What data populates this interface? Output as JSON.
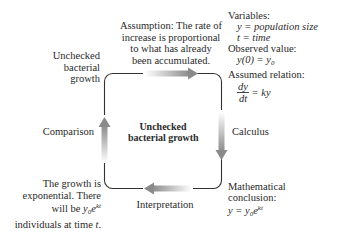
{
  "diagram": {
    "center_label": [
      "Unchecked",
      "bacterial growth"
    ],
    "stages": {
      "top": "Assumption: The rate of increase is proportional to what has already been accumulated.",
      "top_lines": [
        "Assumption: The rate of",
        "increase is proportional",
        "to what has already",
        "been accumulated."
      ],
      "right": "Calculus",
      "bottom": "Interpretation",
      "left": "Comparison"
    },
    "corners": {
      "top_left": [
        "Unchecked",
        "bacterial",
        "growth"
      ],
      "top_right": {
        "variables_heading": "Variables:",
        "var_y": "y  =  population size",
        "var_t": "t  =  time",
        "observed_heading": "Observed value:",
        "observed_lhs": "y(0)  =  y",
        "observed_sub": "0",
        "assumed_heading": "Assumed relation:",
        "deriv_num": "dy",
        "deriv_den": "dt",
        "deriv_rhs": "=  ky"
      },
      "bottom_right": {
        "line1": "Mathematical",
        "line2": "conclusion:",
        "eq_lhs": "y  =  y",
        "eq_sub": "0",
        "eq_base": "e",
        "eq_exp": "kt"
      },
      "bottom_left": {
        "line1": "The growth is",
        "line2": "exponential. There",
        "line3_pre": "will be ",
        "line3_y": "y",
        "line3_sub": "0",
        "line3_e": "e",
        "line3_exp": "kt",
        "line4_pre": "individuals at time ",
        "line4_t": "t",
        "line4_post": "."
      }
    },
    "colors": {
      "line": "#333333",
      "arrow_dark": "#8a8a8a",
      "arrow_light": "#f2f2f2",
      "text": "#2a2a2a"
    }
  }
}
